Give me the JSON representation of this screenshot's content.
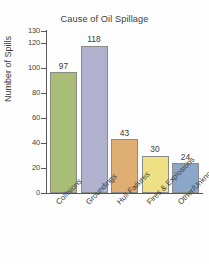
{
  "chart_data": {
    "type": "bar",
    "title": "Cause of Oil Spillage",
    "xlabel": "",
    "ylabel": "Number of Spills",
    "categories": [
      "Collisions",
      "Groundings",
      "Hull Failures",
      "Fires & Explosions",
      "Other/Unknown"
    ],
    "values": [
      97,
      118,
      43,
      30,
      24
    ],
    "ylim": [
      0,
      130
    ],
    "yticks": [
      0,
      20,
      40,
      60,
      80,
      100,
      120,
      130
    ],
    "ytick_labels": [
      "0",
      "20",
      "40",
      "60",
      "80",
      "100",
      "120",
      "130"
    ],
    "grid": false,
    "legend": "none",
    "bar_colors": [
      "#a9bd77",
      "#b0b0cf",
      "#dfae72",
      "#eee085",
      "#8aa6c9"
    ],
    "bar_border_color": "#8c8c86",
    "axis_color": "#585858",
    "data_labels": [
      "97",
      "118",
      "43",
      "30",
      "24"
    ]
  }
}
